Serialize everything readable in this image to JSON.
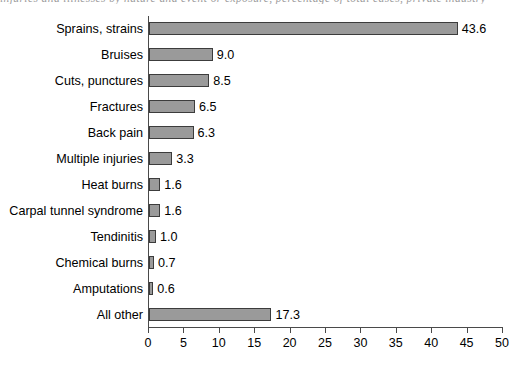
{
  "caption_remnant": "injuries and illnesses by nature and event or exposure, percentage of total cases, private industry",
  "chart_data": {
    "type": "bar",
    "orientation": "horizontal",
    "title": "",
    "subtitle": "",
    "xlabel": "",
    "ylabel": "",
    "categories": [
      "Sprains, strains",
      "Bruises",
      "Cuts, punctures",
      "Fractures",
      "Back pain",
      "Multiple injuries",
      "Heat burns",
      "Carpal tunnel syndrome",
      "Tendinitis",
      "Chemical burns",
      "Amputations",
      "All other"
    ],
    "values": [
      43.6,
      9.0,
      8.5,
      6.5,
      6.3,
      3.3,
      1.6,
      1.6,
      1.0,
      0.7,
      0.6,
      17.3
    ],
    "value_labels": [
      "43.6",
      "9.0",
      "8.5",
      "6.5",
      "6.3",
      "3.3",
      "1.6",
      "1.6",
      "1.0",
      "0.7",
      "0.6",
      "17.3"
    ],
    "xlim": [
      0,
      50
    ],
    "xticks": [
      0,
      5,
      10,
      15,
      20,
      25,
      30,
      35,
      40,
      45,
      50
    ],
    "xtick_labels": [
      "0",
      "5",
      "10",
      "15",
      "20",
      "25",
      "30",
      "35",
      "40",
      "45",
      "50"
    ],
    "grid": false,
    "legend": null,
    "bar_color": "#9a9a9a",
    "bar_border_color": "#3c3c3c",
    "axis_color": "#4a4a4a",
    "text_color": "#000000"
  }
}
